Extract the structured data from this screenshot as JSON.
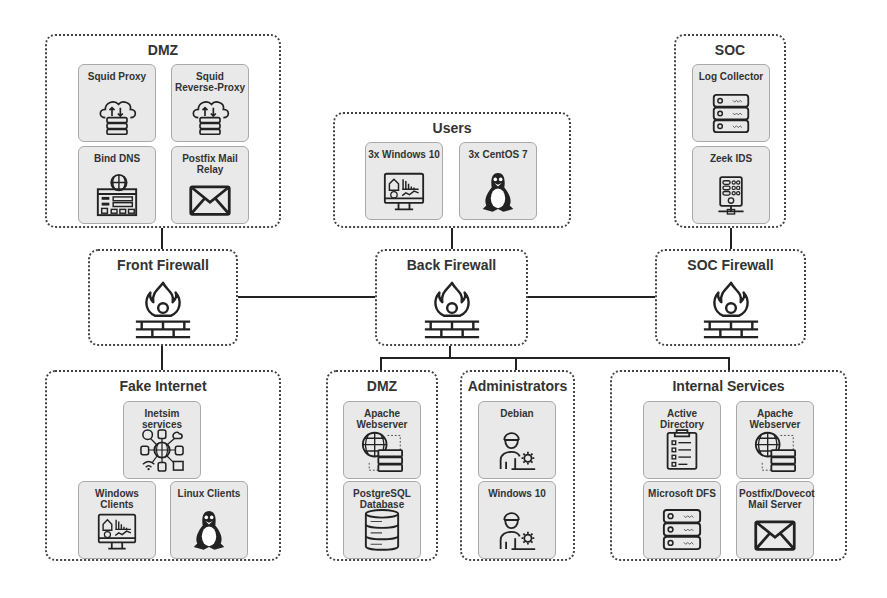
{
  "groups": {
    "dmz_top": {
      "title": "DMZ",
      "cards": [
        {
          "label": "Squid Proxy",
          "icon": "cloud-server-icon"
        },
        {
          "label": "Squid Reverse-Proxy",
          "icon": "cloud-server-icon"
        },
        {
          "label": "Bind DNS",
          "icon": "dns-globe-icon"
        },
        {
          "label": "Postfix Mail Relay",
          "icon": "mail-envelope-icon"
        }
      ]
    },
    "users": {
      "title": "Users",
      "cards": [
        {
          "label": "3x Windows 10",
          "icon": "monitor-dashboard-icon"
        },
        {
          "label": "3x CentOS 7",
          "icon": "linux-penguin-icon"
        }
      ]
    },
    "soc": {
      "title": "SOC",
      "cards": [
        {
          "label": "Log Collector",
          "icon": "server-rack-icon"
        },
        {
          "label": "Zeek IDS",
          "icon": "network-server-icon"
        }
      ]
    },
    "fake_internet": {
      "title": "Fake Internet",
      "cards": [
        {
          "label": "Inetsim services",
          "icon": "network-hub-icon"
        },
        {
          "label": "Windows Clients",
          "icon": "monitor-dashboard-icon"
        },
        {
          "label": "Linux Clients",
          "icon": "linux-penguin-icon"
        }
      ]
    },
    "dmz_bottom": {
      "title": "DMZ",
      "cards": [
        {
          "label": "Apache Webserver",
          "icon": "web-server-icon"
        },
        {
          "label": "PostgreSQL Database",
          "icon": "database-icon"
        }
      ]
    },
    "administrators": {
      "title": "Administrators",
      "cards": [
        {
          "label": "Debian",
          "icon": "admin-user-icon"
        },
        {
          "label": "Windows 10",
          "icon": "admin-user-icon"
        }
      ]
    },
    "internal_services": {
      "title": "Internal Services",
      "cards": [
        {
          "label": "Active Directory",
          "icon": "clipboard-checklist-icon"
        },
        {
          "label": "Apache Webserver",
          "icon": "web-server-icon"
        },
        {
          "label": "Microsoft DFS",
          "icon": "server-rack-icon"
        },
        {
          "label": "Postfix/Dovecot Mail Server",
          "icon": "mail-envelope-icon"
        }
      ]
    }
  },
  "firewalls": {
    "front": {
      "title": "Front Firewall",
      "icon": "firewall-icon"
    },
    "back": {
      "title": "Back Firewall",
      "icon": "firewall-icon"
    },
    "soc": {
      "title": "SOC Firewall",
      "icon": "firewall-icon"
    }
  }
}
